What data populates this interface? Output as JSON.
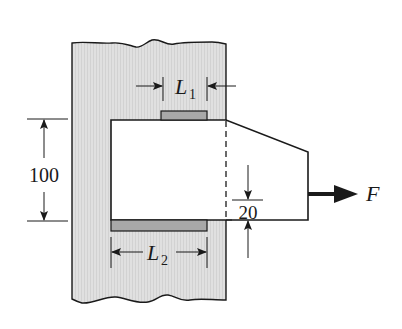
{
  "diagram": {
    "type": "welded bracket (fillet welds) attached to plate",
    "labels": {
      "weld_top": "L",
      "weld_top_sub": "1",
      "weld_bottom": "L",
      "weld_bottom_sub": "2",
      "height_dim": "100",
      "offset_dim": "20",
      "force": "F"
    },
    "colors": {
      "plate_fill": "#dcdcdc",
      "weld_fill": "#a8a8a8",
      "line": "#1a1a1a",
      "background": "#ffffff"
    }
  }
}
